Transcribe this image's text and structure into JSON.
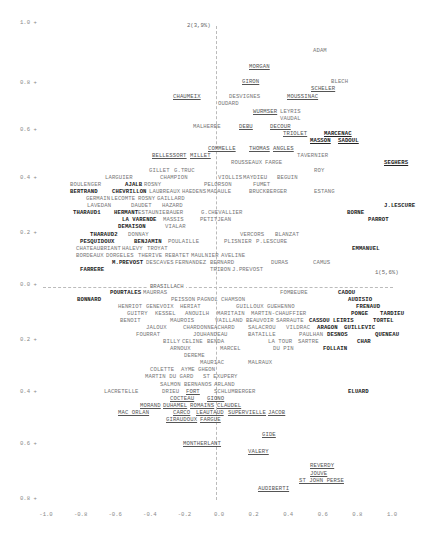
{
  "chart_data": {
    "type": "scatter",
    "title": "",
    "xlabel": "",
    "ylabel": "",
    "axis1_label": "1(5,6%)",
    "axis2_label": "2(3,9%)",
    "axis_line_label": "BRASILLACH",
    "xlim": [
      -1.0,
      1.0
    ],
    "ylim": [
      -0.8,
      1.0
    ],
    "grid": false,
    "legend": "none",
    "x_ticks": [
      "-1.0",
      "-0.8",
      "-0.6",
      "-0.4",
      "-0.2",
      "0.0",
      "0.2",
      "0.4",
      "0.6",
      "0.8",
      "1.0"
    ],
    "y_ticks": [
      {
        "label": "1.0 +",
        "y": 23
      },
      {
        "label": "0.8 +",
        "y": 83
      },
      {
        "label": "0.6 +",
        "y": 130
      },
      {
        "label": "0.4 +",
        "y": 178
      },
      {
        "label": "0.2 +",
        "y": 233
      },
      {
        "label": "0.0 +",
        "y": 285
      },
      {
        "label": "0.2 +",
        "y": 340
      },
      {
        "label": "0.4 +",
        "y": 392
      },
      {
        "label": "0.6 +",
        "y": 444
      },
      {
        "label": "0.8 +",
        "y": 499
      }
    ],
    "points": [
      {
        "name": "ADAM",
        "x": 313,
        "y": 51,
        "s": "n"
      },
      {
        "name": "MORGAN",
        "x": 249,
        "y": 67,
        "s": "u"
      },
      {
        "name": "GIRON",
        "x": 242,
        "y": 82,
        "s": "u"
      },
      {
        "name": "BLECH",
        "x": 331,
        "y": 82,
        "s": "n"
      },
      {
        "name": "SCHELER",
        "x": 311,
        "y": 89,
        "s": "u"
      },
      {
        "name": "CHAUMEIX",
        "x": 173,
        "y": 97,
        "s": "u"
      },
      {
        "name": "DESVIGNES",
        "x": 229,
        "y": 97,
        "s": "n"
      },
      {
        "name": "MOUSSINAC",
        "x": 287,
        "y": 97,
        "s": "u"
      },
      {
        "name": "OUDARD",
        "x": 218,
        "y": 104,
        "s": "n"
      },
      {
        "name": "WURMSER",
        "x": 253,
        "y": 112,
        "s": "u"
      },
      {
        "name": "LEYRIS",
        "x": 280,
        "y": 112,
        "s": "n"
      },
      {
        "name": "VAUDAL",
        "x": 280,
        "y": 119,
        "s": "n"
      },
      {
        "name": "MALHERBE",
        "x": 193,
        "y": 127,
        "s": "n"
      },
      {
        "name": "DEBU",
        "x": 239,
        "y": 127,
        "s": "u"
      },
      {
        "name": "DECOUR",
        "x": 270,
        "y": 127,
        "s": "u"
      },
      {
        "name": "TRIOLET",
        "x": 283,
        "y": 134,
        "s": "u"
      },
      {
        "name": "MARCENAC",
        "x": 324,
        "y": 134,
        "s": "bu"
      },
      {
        "name": "MASSON",
        "x": 310,
        "y": 141,
        "s": "bu"
      },
      {
        "name": "SADOUL",
        "x": 338,
        "y": 141,
        "s": "bu"
      },
      {
        "name": "COMMELLE",
        "x": 208,
        "y": 149,
        "s": "u"
      },
      {
        "name": "THOMAS",
        "x": 249,
        "y": 149,
        "s": "u"
      },
      {
        "name": "ANGLES",
        "x": 273,
        "y": 149,
        "s": "u"
      },
      {
        "name": "TAVERNIER",
        "x": 297,
        "y": 156,
        "s": "n"
      },
      {
        "name": "BELLESSORT",
        "x": 152,
        "y": 156,
        "s": "u"
      },
      {
        "name": "MILLET",
        "x": 190,
        "y": 156,
        "s": "u"
      },
      {
        "name": "ROUSSEAUX",
        "x": 231,
        "y": 163,
        "s": "n"
      },
      {
        "name": "FARGE",
        "x": 265,
        "y": 163,
        "s": "n"
      },
      {
        "name": "SEGHERS",
        "x": 384,
        "y": 163,
        "s": "bu"
      },
      {
        "name": "GILLET",
        "x": 149,
        "y": 171,
        "s": "n"
      },
      {
        "name": "G.TRUC",
        "x": 174,
        "y": 171,
        "s": "n"
      },
      {
        "name": "ROY",
        "x": 314,
        "y": 171,
        "s": "n"
      },
      {
        "name": "LARGUIER",
        "x": 105,
        "y": 178,
        "s": "n"
      },
      {
        "name": "CHAMPION",
        "x": 160,
        "y": 178,
        "s": "n"
      },
      {
        "name": "VIOLLIS",
        "x": 218,
        "y": 178,
        "s": "n"
      },
      {
        "name": "MAYDIEU",
        "x": 243,
        "y": 178,
        "s": "n"
      },
      {
        "name": "BEGUIN",
        "x": 277,
        "y": 178,
        "s": "n"
      },
      {
        "name": "BOULENGER",
        "x": 70,
        "y": 185,
        "s": "n"
      },
      {
        "name": "AJALB",
        "x": 125,
        "y": 185,
        "s": "b"
      },
      {
        "name": "ROSNY",
        "x": 144,
        "y": 185,
        "s": "n"
      },
      {
        "name": "PELORSON",
        "x": 204,
        "y": 185,
        "s": "n"
      },
      {
        "name": "FUMET",
        "x": 253,
        "y": 185,
        "s": "n"
      },
      {
        "name": "BERTRAND",
        "x": 70,
        "y": 192,
        "s": "b"
      },
      {
        "name": "CHEVRILLON",
        "x": 112,
        "y": 192,
        "s": "b"
      },
      {
        "name": "LAUBREAUX",
        "x": 149,
        "y": 192,
        "s": "n"
      },
      {
        "name": "HAEDENS",
        "x": 182,
        "y": 192,
        "s": "n"
      },
      {
        "name": "MADAULE",
        "x": 207,
        "y": 192,
        "s": "n"
      },
      {
        "name": "BRUCKBERGER",
        "x": 249,
        "y": 192,
        "s": "n"
      },
      {
        "name": "ESTANG",
        "x": 314,
        "y": 192,
        "s": "n"
      },
      {
        "name": "GERMAIN",
        "x": 86,
        "y": 199,
        "s": "n"
      },
      {
        "name": "LECOMTE",
        "x": 111,
        "y": 199,
        "s": "n"
      },
      {
        "name": "ROSNY",
        "x": 138,
        "y": 199,
        "s": "n"
      },
      {
        "name": "GAILLARD",
        "x": 157,
        "y": 199,
        "s": "n"
      },
      {
        "name": "LAVEDAN",
        "x": 87,
        "y": 206,
        "s": "n"
      },
      {
        "name": "DAUDET",
        "x": 131,
        "y": 206,
        "s": "n"
      },
      {
        "name": "HAZARD",
        "x": 162,
        "y": 206,
        "s": "n"
      },
      {
        "name": "J.LESCURE",
        "x": 384,
        "y": 206,
        "s": "b"
      },
      {
        "name": "THARAUD1",
        "x": 73,
        "y": 213,
        "s": "b"
      },
      {
        "name": "HERMANT",
        "x": 114,
        "y": 213,
        "s": "b"
      },
      {
        "name": "ESTAUNIE",
        "x": 138,
        "y": 213,
        "s": "n"
      },
      {
        "name": "BAUER",
        "x": 166,
        "y": 213,
        "s": "n"
      },
      {
        "name": "G.CHEVALLIER",
        "x": 201,
        "y": 213,
        "s": "n"
      },
      {
        "name": "BORNE",
        "x": 347,
        "y": 213,
        "s": "b"
      },
      {
        "name": "LA VARENDE",
        "x": 122,
        "y": 220,
        "s": "b"
      },
      {
        "name": "MASSIS",
        "x": 163,
        "y": 220,
        "s": "n"
      },
      {
        "name": "PETITJEAN",
        "x": 200,
        "y": 220,
        "s": "n"
      },
      {
        "name": "PARROT",
        "x": 368,
        "y": 220,
        "s": "b"
      },
      {
        "name": "DEMAISON",
        "x": 118,
        "y": 227,
        "s": "b"
      },
      {
        "name": "VIALAR",
        "x": 165,
        "y": 227,
        "s": "n"
      },
      {
        "name": "THARAUD2",
        "x": 90,
        "y": 235,
        "s": "b"
      },
      {
        "name": "DONNAY",
        "x": 128,
        "y": 235,
        "s": "n"
      },
      {
        "name": "VERCORS",
        "x": 240,
        "y": 235,
        "s": "n"
      },
      {
        "name": "BLANZAT",
        "x": 275,
        "y": 235,
        "s": "n"
      },
      {
        "name": "PESQUIDOUX",
        "x": 80,
        "y": 242,
        "s": "b"
      },
      {
        "name": "BENJAMIN",
        "x": 134,
        "y": 242,
        "s": "b"
      },
      {
        "name": "POULAILLE",
        "x": 168,
        "y": 242,
        "s": "n"
      },
      {
        "name": "PLISNIER",
        "x": 224,
        "y": 242,
        "s": "n"
      },
      {
        "name": "P.LESCURE",
        "x": 256,
        "y": 242,
        "s": "n"
      },
      {
        "name": "CHATEAUBRIANT",
        "x": 76,
        "y": 249,
        "s": "n"
      },
      {
        "name": "HALEVY",
        "x": 122,
        "y": 249,
        "s": "n"
      },
      {
        "name": "TROYAT",
        "x": 147,
        "y": 249,
        "s": "n"
      },
      {
        "name": "EMMANUEL",
        "x": 352,
        "y": 249,
        "s": "b"
      },
      {
        "name": "BORDEAUX",
        "x": 76,
        "y": 256,
        "s": "n"
      },
      {
        "name": "DORGELES",
        "x": 106,
        "y": 256,
        "s": "n"
      },
      {
        "name": "THERIVE",
        "x": 138,
        "y": 256,
        "s": "n"
      },
      {
        "name": "REBATET",
        "x": 165,
        "y": 256,
        "s": "n"
      },
      {
        "name": "MAULNIER",
        "x": 191,
        "y": 256,
        "s": "n"
      },
      {
        "name": "AVELINE",
        "x": 221,
        "y": 256,
        "s": "n"
      },
      {
        "name": "M.PREVOST",
        "x": 112,
        "y": 263,
        "s": "b"
      },
      {
        "name": "DESCAVES",
        "x": 146,
        "y": 263,
        "s": "n"
      },
      {
        "name": "FERNANDEZ",
        "x": 175,
        "y": 263,
        "s": "n"
      },
      {
        "name": "BERNARD",
        "x": 210,
        "y": 263,
        "s": "n"
      },
      {
        "name": "DURAS",
        "x": 271,
        "y": 263,
        "s": "n"
      },
      {
        "name": "CAMUS",
        "x": 313,
        "y": 263,
        "s": "n"
      },
      {
        "name": "FARRERE",
        "x": 80,
        "y": 270,
        "s": "b"
      },
      {
        "name": "TRIBON",
        "x": 210,
        "y": 270,
        "s": "n"
      },
      {
        "name": "J.PREVOST",
        "x": 232,
        "y": 270,
        "s": "n"
      },
      {
        "name": "POURTALES",
        "x": 110,
        "y": 293,
        "s": "b"
      },
      {
        "name": "MAURRAS",
        "x": 143,
        "y": 293,
        "s": "n"
      },
      {
        "name": "FOMBEURE",
        "x": 280,
        "y": 293,
        "s": "n"
      },
      {
        "name": "CADOU",
        "x": 338,
        "y": 293,
        "s": "b"
      },
      {
        "name": "BONNARD",
        "x": 77,
        "y": 300,
        "s": "b"
      },
      {
        "name": "PEISSON",
        "x": 171,
        "y": 300,
        "s": "n"
      },
      {
        "name": "PAGNOL",
        "x": 197,
        "y": 300,
        "s": "n"
      },
      {
        "name": "CHAMSON",
        "x": 221,
        "y": 300,
        "s": "n"
      },
      {
        "name": "AUDISIO",
        "x": 348,
        "y": 300,
        "s": "b"
      },
      {
        "name": "HENRIOT",
        "x": 118,
        "y": 307,
        "s": "n"
      },
      {
        "name": "GENEVOIX",
        "x": 146,
        "y": 307,
        "s": "n"
      },
      {
        "name": "HERIAT",
        "x": 180,
        "y": 307,
        "s": "n"
      },
      {
        "name": "GUILLOUX",
        "x": 236,
        "y": 307,
        "s": "n"
      },
      {
        "name": "GUEHENNO",
        "x": 267,
        "y": 307,
        "s": "n"
      },
      {
        "name": "FRENAUD",
        "x": 356,
        "y": 307,
        "s": "b"
      },
      {
        "name": "GUITRY",
        "x": 127,
        "y": 314,
        "s": "n"
      },
      {
        "name": "KESSEL",
        "x": 155,
        "y": 314,
        "s": "n"
      },
      {
        "name": "ANOUILH",
        "x": 185,
        "y": 314,
        "s": "n"
      },
      {
        "name": "MARITAIN",
        "x": 217,
        "y": 314,
        "s": "n"
      },
      {
        "name": "MARTIN-CHAUFFIER",
        "x": 251,
        "y": 314,
        "s": "n"
      },
      {
        "name": "PONGE",
        "x": 351,
        "y": 314,
        "s": "b"
      },
      {
        "name": "TARDIEU",
        "x": 380,
        "y": 314,
        "s": "b"
      },
      {
        "name": "BENOIT",
        "x": 120,
        "y": 321,
        "s": "n"
      },
      {
        "name": "MAUROIS",
        "x": 170,
        "y": 321,
        "s": "n"
      },
      {
        "name": "VAILLAND",
        "x": 215,
        "y": 321,
        "s": "n"
      },
      {
        "name": "BEAUVOIR",
        "x": 246,
        "y": 321,
        "s": "n"
      },
      {
        "name": "SARRAUTE",
        "x": 276,
        "y": 321,
        "s": "n"
      },
      {
        "name": "CASSOU",
        "x": 309,
        "y": 321,
        "s": "b"
      },
      {
        "name": "LEIRIS",
        "x": 333,
        "y": 321,
        "s": "b"
      },
      {
        "name": "TORTEL",
        "x": 373,
        "y": 321,
        "s": "b"
      },
      {
        "name": "JALOUX",
        "x": 146,
        "y": 328,
        "s": "n"
      },
      {
        "name": "CHARDONNE",
        "x": 183,
        "y": 328,
        "s": "n"
      },
      {
        "name": "ACHARD",
        "x": 214,
        "y": 328,
        "s": "n"
      },
      {
        "name": "SALACROU",
        "x": 248,
        "y": 328,
        "s": "n"
      },
      {
        "name": "VILDRAC",
        "x": 286,
        "y": 328,
        "s": "n"
      },
      {
        "name": "ARAGON",
        "x": 317,
        "y": 328,
        "s": "b"
      },
      {
        "name": "GUILLEVIC",
        "x": 344,
        "y": 328,
        "s": "b"
      },
      {
        "name": "FOURRAT",
        "x": 136,
        "y": 335,
        "s": "n"
      },
      {
        "name": "JOUHANDEAU",
        "x": 193,
        "y": 335,
        "s": "n"
      },
      {
        "name": "BATAILLE",
        "x": 248,
        "y": 335,
        "s": "n"
      },
      {
        "name": "PAULHAN",
        "x": 299,
        "y": 335,
        "s": "n"
      },
      {
        "name": "DESNOS",
        "x": 327,
        "y": 335,
        "s": "b"
      },
      {
        "name": "QUENEAU",
        "x": 375,
        "y": 335,
        "s": "b"
      },
      {
        "name": "BILLY",
        "x": 163,
        "y": 342,
        "s": "n"
      },
      {
        "name": "CELINE",
        "x": 182,
        "y": 342,
        "s": "n"
      },
      {
        "name": "BENDA",
        "x": 207,
        "y": 342,
        "s": "n"
      },
      {
        "name": "LA TOUR",
        "x": 268,
        "y": 342,
        "s": "n"
      },
      {
        "name": "SARTRE",
        "x": 298,
        "y": 342,
        "s": "n"
      },
      {
        "name": "CHAR",
        "x": 357,
        "y": 342,
        "s": "b"
      },
      {
        "name": "ARNOUX",
        "x": 170,
        "y": 349,
        "s": "n"
      },
      {
        "name": "MARCEL",
        "x": 220,
        "y": 349,
        "s": "n"
      },
      {
        "name": "DU PIN",
        "x": 273,
        "y": 349,
        "s": "n"
      },
      {
        "name": "FOLLAIN",
        "x": 323,
        "y": 349,
        "s": "b"
      },
      {
        "name": "DEREME",
        "x": 184,
        "y": 356,
        "s": "n"
      },
      {
        "name": "MAURIAC",
        "x": 200,
        "y": 363,
        "s": "n"
      },
      {
        "name": "MALRAUX",
        "x": 248,
        "y": 363,
        "s": "n"
      },
      {
        "name": "COLETTE",
        "x": 150,
        "y": 370,
        "s": "n"
      },
      {
        "name": "AYME",
        "x": 181,
        "y": 370,
        "s": "n"
      },
      {
        "name": "GHEON",
        "x": 198,
        "y": 370,
        "s": "n"
      },
      {
        "name": "MARTIN DU GARD",
        "x": 145,
        "y": 377,
        "s": "n"
      },
      {
        "name": "ST EXUPERY",
        "x": 203,
        "y": 377,
        "s": "n"
      },
      {
        "name": "SALMON",
        "x": 160,
        "y": 385,
        "s": "n"
      },
      {
        "name": "BERNANOS",
        "x": 184,
        "y": 385,
        "s": "n"
      },
      {
        "name": "ARLAND",
        "x": 214,
        "y": 385,
        "s": "n"
      },
      {
        "name": "ELUARD",
        "x": 348,
        "y": 392,
        "s": "b"
      },
      {
        "name": "LACRETELLE",
        "x": 104,
        "y": 392,
        "s": "n"
      },
      {
        "name": "DRIEU",
        "x": 162,
        "y": 392,
        "s": "n"
      },
      {
        "name": "FORT",
        "x": 186,
        "y": 392,
        "s": "u"
      },
      {
        "name": "SCHLUMBERGER",
        "x": 214,
        "y": 392,
        "s": "n"
      },
      {
        "name": "COCTEAU",
        "x": 170,
        "y": 399,
        "s": "u"
      },
      {
        "name": "GIONO",
        "x": 207,
        "y": 399,
        "s": "u"
      },
      {
        "name": "MORAND",
        "x": 140,
        "y": 406,
        "s": "u"
      },
      {
        "name": "DUHAMEL",
        "x": 163,
        "y": 406,
        "s": "u"
      },
      {
        "name": "ROMAINS",
        "x": 190,
        "y": 406,
        "s": "u"
      },
      {
        "name": "CLAUDEL",
        "x": 217,
        "y": 406,
        "s": "u"
      },
      {
        "name": "MAC ORLAN",
        "x": 118,
        "y": 413,
        "s": "u"
      },
      {
        "name": "CARCO",
        "x": 173,
        "y": 413,
        "s": "u"
      },
      {
        "name": "LEAUTAUD",
        "x": 196,
        "y": 413,
        "s": "u"
      },
      {
        "name": "SUPERVIELLE",
        "x": 228,
        "y": 413,
        "s": "u"
      },
      {
        "name": "JACOB",
        "x": 268,
        "y": 413,
        "s": "u"
      },
      {
        "name": "GIRAUDOUX",
        "x": 166,
        "y": 420,
        "s": "u"
      },
      {
        "name": "FARGUE",
        "x": 200,
        "y": 420,
        "s": "u"
      },
      {
        "name": "GIDE",
        "x": 262,
        "y": 435,
        "s": "u"
      },
      {
        "name": "MONTHERLANT",
        "x": 183,
        "y": 444,
        "s": "u"
      },
      {
        "name": "VALERY",
        "x": 248,
        "y": 452,
        "s": "u"
      },
      {
        "name": "REVERDY",
        "x": 310,
        "y": 466,
        "s": "u"
      },
      {
        "name": "JOUVE",
        "x": 310,
        "y": 474,
        "s": "u"
      },
      {
        "name": "ST JOHN PERSE",
        "x": 299,
        "y": 481,
        "s": "u"
      },
      {
        "name": "AUDIBERTI",
        "x": 258,
        "y": 489,
        "s": "u"
      }
    ]
  }
}
